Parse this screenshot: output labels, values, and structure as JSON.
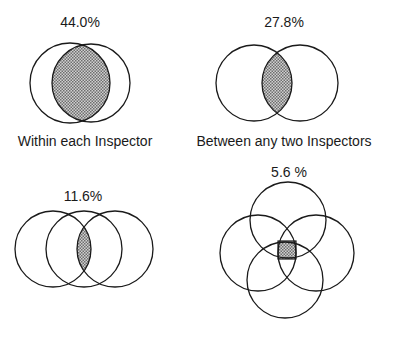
{
  "panels": [
    {
      "id": "within",
      "percent": "44.0%",
      "caption": "Within each Inspector"
    },
    {
      "id": "between",
      "percent": "27.8%",
      "caption": "Between any two Inspectors"
    },
    {
      "id": "three",
      "percent": "11.6%",
      "caption": ""
    },
    {
      "id": "four",
      "percent": "5.6 %",
      "caption": ""
    }
  ],
  "colors": {
    "stroke": "#1a1a1a",
    "shade_dark": "#6e6e6e",
    "shade_light": "#d0d0d0",
    "background": "#ffffff"
  }
}
